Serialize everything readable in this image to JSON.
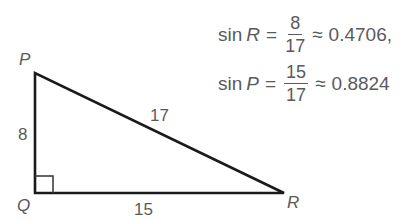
{
  "equations": [
    {
      "func": "sin",
      "var": "R",
      "eq": "=",
      "numerator": "8",
      "denominator": "17",
      "approx": "≈",
      "value": "0.4706,"
    },
    {
      "func": "sin",
      "var": "P",
      "eq": "=",
      "numerator": "15",
      "denominator": "17",
      "approx": "≈",
      "value": "0.8824"
    }
  ],
  "triangle": {
    "vertices": {
      "P": "P",
      "Q": "Q",
      "R": "R"
    },
    "sides": {
      "PQ": "8",
      "PR": "17",
      "QR": "15"
    },
    "right_angle_at": "Q"
  }
}
